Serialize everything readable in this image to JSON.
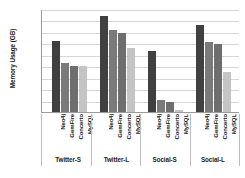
{
  "chart_data": {
    "type": "bar",
    "title": "",
    "xlabel": "",
    "ylabel": "Memory Usage (GB)",
    "yscale": "log2",
    "ylim": [
      1,
      512
    ],
    "yticks": [
      512,
      256,
      128,
      64,
      32,
      16,
      8,
      4,
      2,
      1
    ],
    "ytick_labels": [
      "512",
      "256",
      "128",
      "64",
      "32",
      "16",
      "8",
      "4",
      "2",
      "1"
    ],
    "grid": true,
    "legend": "none",
    "categories": [
      "Twitter-S",
      "Twitter-L",
      "Social-S",
      "Social-L"
    ],
    "series": [
      {
        "name": "Neo4j",
        "color": "#404040",
        "values": [
          72,
          330,
          40,
          200
        ]
      },
      {
        "name": "GemFire",
        "color": "#7a7a7a",
        "values": [
          19,
          140,
          2.1,
          68
        ]
      },
      {
        "name": "Concerto",
        "color": "#6e6e6e",
        "values": [
          16,
          120,
          1.8,
          60
        ]
      },
      {
        "name": "MySQL",
        "color": "#c4c4c4",
        "values": [
          16,
          48,
          1.15,
          11
        ]
      }
    ],
    "series_names": [
      "Neo4j",
      "GemFire",
      "Concerto",
      "MySQL"
    ]
  },
  "colors": {
    "background": "#ffffff",
    "axis": "#9a9a9a",
    "grid": "#d6d6d6",
    "text": "#1a1a1a"
  }
}
